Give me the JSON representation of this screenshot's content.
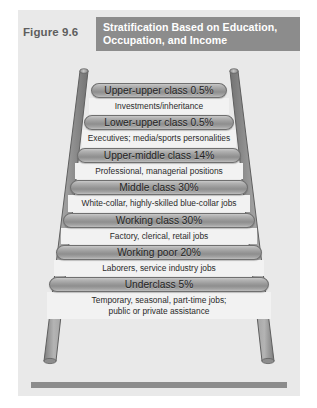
{
  "figure": {
    "number_label": "Figure 9.6",
    "title": "Stratification Based on Education, Occupation, and Income",
    "header_color": "#8c8c8c",
    "panel_color": "#e9e9e9",
    "rung_color": "#9a9a9a",
    "rail_color": "#a0a0a0"
  },
  "ladder": {
    "steps": [
      {
        "class_label": "Upper-upper class 0.5%",
        "class_name": "Upper-upper class",
        "percent": "0.5%",
        "description": "Investments/inheritance",
        "description_line1": "Investments/inheritance",
        "description_line2": ""
      },
      {
        "class_label": "Lower-upper class 0.5%",
        "class_name": "Lower-upper class",
        "percent": "0.5%",
        "description": "Executives; media/sports personalities",
        "description_line1": "Executives; media/sports personalities",
        "description_line2": ""
      },
      {
        "class_label": "Upper-middle class 14%",
        "class_name": "Upper-middle class",
        "percent": "14%",
        "description": "Professional, managerial positions",
        "description_line1": "Professional, managerial positions",
        "description_line2": ""
      },
      {
        "class_label": "Middle class 30%",
        "class_name": "Middle class",
        "percent": "30%",
        "description": "White-collar, highly-skilled blue-collar jobs",
        "description_line1": "White-collar, highly-skilled blue-collar jobs",
        "description_line2": ""
      },
      {
        "class_label": "Working class 30%",
        "class_name": "Working class",
        "percent": "30%",
        "description": "Factory, clerical, retail jobs",
        "description_line1": "Factory, clerical, retail jobs",
        "description_line2": ""
      },
      {
        "class_label": "Working poor 20%",
        "class_name": "Working poor",
        "percent": "20%",
        "description": "Laborers, service industry jobs",
        "description_line1": "Laborers, service industry jobs",
        "description_line2": ""
      },
      {
        "class_label": "Underclass 5%",
        "class_name": "Underclass",
        "percent": "5%",
        "description": "Temporary, seasonal, part-time jobs; public or private assistance",
        "description_line1": "Temporary, seasonal, part-time jobs;",
        "description_line2": "public or private assistance"
      }
    ]
  }
}
